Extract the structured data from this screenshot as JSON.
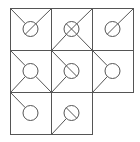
{
  "game": {
    "type": "diagonal-wire-puzzle",
    "grid": {
      "origin_x": 10,
      "origin_y": 8,
      "cell_w": 41,
      "cell_h": 42,
      "line_color": "#555555",
      "background": "#ffffff",
      "node_radius": 7.5
    },
    "cells": [
      {
        "row": 0,
        "col": 0,
        "wires": [
          "tl",
          "tr"
        ],
        "mark": "slash"
      },
      {
        "row": 0,
        "col": 1,
        "wires": [
          "tr",
          "bl",
          "br"
        ],
        "mark": "cross"
      },
      {
        "row": 0,
        "col": 2,
        "wires": [
          "tr"
        ],
        "mark": "slash"
      },
      {
        "row": 1,
        "col": 0,
        "wires": [
          "tl",
          "bl",
          "br"
        ],
        "mark": "none"
      },
      {
        "row": 1,
        "col": 1,
        "wires": [
          "tl",
          "bl"
        ],
        "mark": "backslash"
      },
      {
        "row": 1,
        "col": 2,
        "wires": [
          "tl",
          "bl"
        ],
        "mark": "none"
      },
      {
        "row": 2,
        "col": 0,
        "wires": [
          "tl"
        ],
        "mark": "none"
      },
      {
        "row": 2,
        "col": 1,
        "wires": [
          "bl"
        ],
        "mark": "backslash"
      }
    ]
  }
}
